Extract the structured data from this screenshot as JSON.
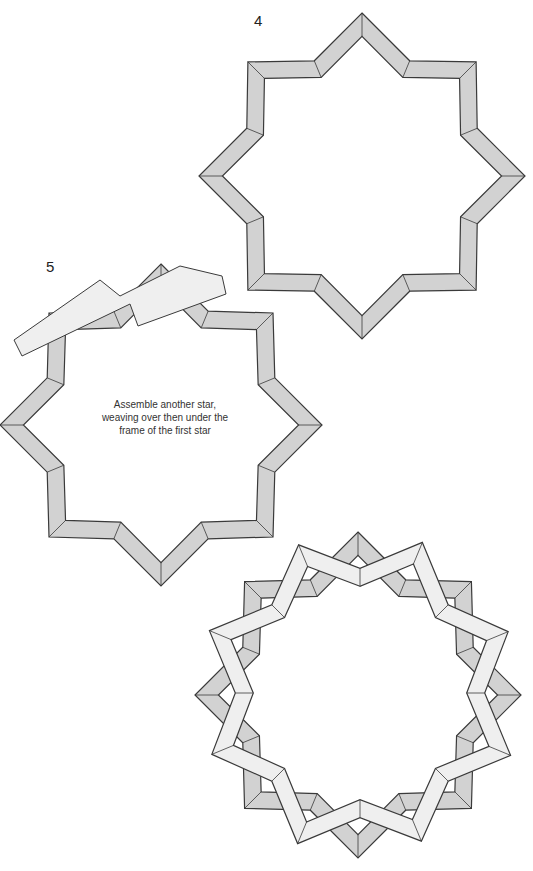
{
  "steps": [
    {
      "number": "4",
      "label_pos": [
        254,
        12
      ]
    },
    {
      "number": "5",
      "label_pos": [
        46,
        258
      ]
    }
  ],
  "caption": {
    "line1": "Assemble another star,",
    "line2": "weaving over then under the",
    "line3": "frame of the first star"
  },
  "colors": {
    "dark_band": "#d2d2d2",
    "light_band": "#efefef",
    "outline": "#3a3a3a"
  },
  "stars": [
    {
      "id": "star-step4",
      "cx": 362,
      "cy": 176,
      "r_point": 163,
      "r_corner": 163,
      "rotation": 0,
      "band": 18,
      "tone": "dark"
    },
    {
      "id": "star-step5",
      "cx": 161,
      "cy": 425,
      "r_point": 161,
      "r_corner": 160,
      "rotation": 0,
      "band": 18,
      "tone": "dark"
    },
    {
      "id": "star-final-dark",
      "cx": 358,
      "cy": 695,
      "r_point": 163,
      "r_corner": 162,
      "rotation": 0,
      "band": 18,
      "tone": "dark"
    },
    {
      "id": "star-final-light",
      "cx": 360,
      "cy": 693,
      "r_point": 163,
      "r_corner": 162,
      "rotation": 22.5,
      "band": 18,
      "tone": "light"
    }
  ],
  "partial_strip": {
    "points": [
      [
        14,
        340
      ],
      [
        100,
        280
      ],
      [
        120,
        296
      ],
      [
        180,
        266
      ],
      [
        222,
        276
      ],
      [
        226,
        294
      ],
      [
        138,
        326
      ],
      [
        130,
        304
      ],
      [
        22,
        356
      ]
    ]
  }
}
